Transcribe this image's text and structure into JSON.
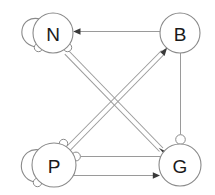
{
  "diagram": {
    "background_color": "#ffffff",
    "edge_color": "#9a9a9a",
    "node_stroke_color": "#8a8a8a",
    "node_fill_color": "#ffffff",
    "label_color": "#1a1a1a",
    "arrow_color": "#3a3a3a",
    "nodes": [
      {
        "id": "N",
        "label": "N",
        "cx": 53,
        "cy": 33,
        "r": 20
      },
      {
        "id": "B",
        "label": "B",
        "cx": 180,
        "cy": 33,
        "r": 20
      },
      {
        "id": "P",
        "label": "P",
        "cx": 54,
        "cy": 165,
        "r": 22
      },
      {
        "id": "G",
        "label": "G",
        "cx": 180,
        "cy": 165,
        "r": 21
      }
    ],
    "edges": [
      {
        "from": "B",
        "to": "N",
        "type": "activation",
        "marker": "arrow",
        "style": "single"
      },
      {
        "from": "P",
        "to": "B",
        "type": "activation",
        "marker": "arrow",
        "style": "double"
      },
      {
        "from": "N",
        "to": "G",
        "type": "activation",
        "marker": "arrow",
        "style": "double"
      },
      {
        "from": "P",
        "to": "G",
        "type": "inhibition",
        "marker": "circle",
        "style": "single"
      },
      {
        "from": "P",
        "to": "G",
        "type": "activation",
        "marker": "arrow",
        "style": "single"
      },
      {
        "from": "B",
        "to": "G",
        "type": "inhibition",
        "marker": "circle",
        "style": "single"
      },
      {
        "from": "N",
        "to": "N",
        "type": "inhibition",
        "marker": "circle",
        "style": "self-loop"
      },
      {
        "from": "P",
        "to": "P",
        "type": "inhibition",
        "marker": "circle",
        "style": "self-loop"
      }
    ]
  }
}
